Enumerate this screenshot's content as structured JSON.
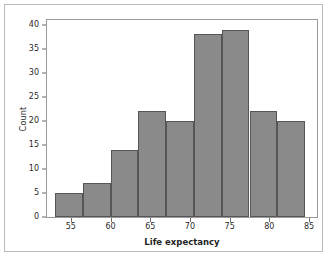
{
  "chart_data": {
    "type": "bar",
    "title": "",
    "subtitle": "",
    "xlabel": "Life expectancy",
    "ylabel": "Count",
    "xlim": [
      52.0,
      86.0
    ],
    "ylim": [
      0,
      41
    ],
    "grid": false,
    "legend": null,
    "bar_color": "#8a8a8a",
    "bar_edge_color": "#565656",
    "axis_color": "#9a9a9a",
    "text_color": "#2b2b2b",
    "background": "#ffffff",
    "histogram": true,
    "bin_edges": [
      53.0,
      56.5,
      60.0,
      63.5,
      67.0,
      70.5,
      74.0,
      77.5,
      81.0,
      84.5
    ],
    "categories": [
      "53.0-56.5",
      "56.5-60.0",
      "60.0-63.5",
      "63.5-67.0",
      "67.0-70.5",
      "70.5-74.0",
      "74.0-77.5",
      "77.5-81.0",
      "81.0-84.5"
    ],
    "values": [
      5,
      7,
      14,
      22,
      20,
      38,
      39,
      22,
      20
    ],
    "xticks": [
      55,
      60,
      65,
      70,
      75,
      80,
      85
    ],
    "xtick_labels": [
      "55",
      "60",
      "65",
      "70",
      "75",
      "80",
      "85"
    ],
    "yticks": [
      0,
      5,
      10,
      15,
      20,
      25,
      30,
      35,
      40
    ],
    "ytick_labels": [
      "0",
      "5",
      "10",
      "15",
      "20",
      "25",
      "30",
      "35",
      "40"
    ]
  }
}
